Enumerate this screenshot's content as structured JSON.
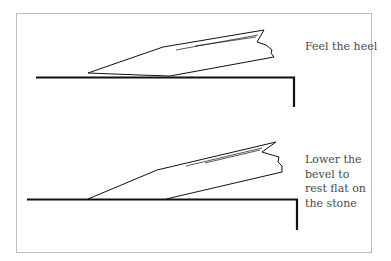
{
  "figure": {
    "panels": [
      {
        "id": "top",
        "caption": "Feel the heel",
        "description": "Chisel blade tilted back, resting on its heel on the sharpening stone"
      },
      {
        "id": "bottom",
        "caption": "Lower the bevel to rest flat on the stone",
        "description": "Chisel blade lowered so the bevel sits flat on the stone"
      }
    ],
    "colors": {
      "frame": "#bdbdbd",
      "ink": "#111111",
      "text": "#4a4a4a",
      "background": "#ffffff"
    }
  }
}
